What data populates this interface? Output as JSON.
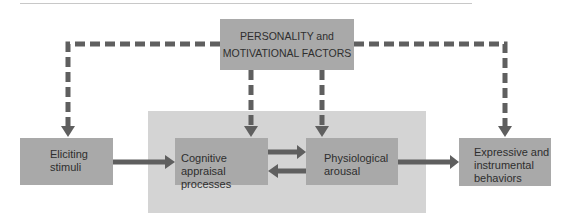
{
  "diagram": {
    "top_box": {
      "line1": "PERSONALITY and",
      "line2": "MOTIVATIONAL FACTORS"
    },
    "nodes": [
      {
        "id": "eliciting",
        "line1": "Eliciting",
        "line2": "stimuli"
      },
      {
        "id": "cognitive",
        "line1": "Cognitive appraisal",
        "line2": "processes"
      },
      {
        "id": "physiological",
        "line1": "Physiological",
        "line2": "arousal"
      },
      {
        "id": "expressive",
        "line1": "Expressive and",
        "line2": "instrumental",
        "line3": "behaviors"
      }
    ],
    "edges": [
      {
        "from": "personality",
        "to": "eliciting",
        "style": "dashed"
      },
      {
        "from": "personality",
        "to": "cognitive",
        "style": "dashed"
      },
      {
        "from": "personality",
        "to": "physiological",
        "style": "dashed"
      },
      {
        "from": "personality",
        "to": "expressive",
        "style": "dashed"
      },
      {
        "from": "eliciting",
        "to": "cognitive",
        "style": "solid"
      },
      {
        "from": "cognitive",
        "to": "physiological",
        "style": "solid"
      },
      {
        "from": "physiological",
        "to": "cognitive",
        "style": "solid"
      },
      {
        "from": "physiological",
        "to": "expressive",
        "style": "solid"
      }
    ],
    "colors": {
      "box": "#a9a9a9",
      "panel": "#d4d4d4",
      "arrow": "#5f5f5f",
      "text": "#2e2e2e"
    }
  }
}
